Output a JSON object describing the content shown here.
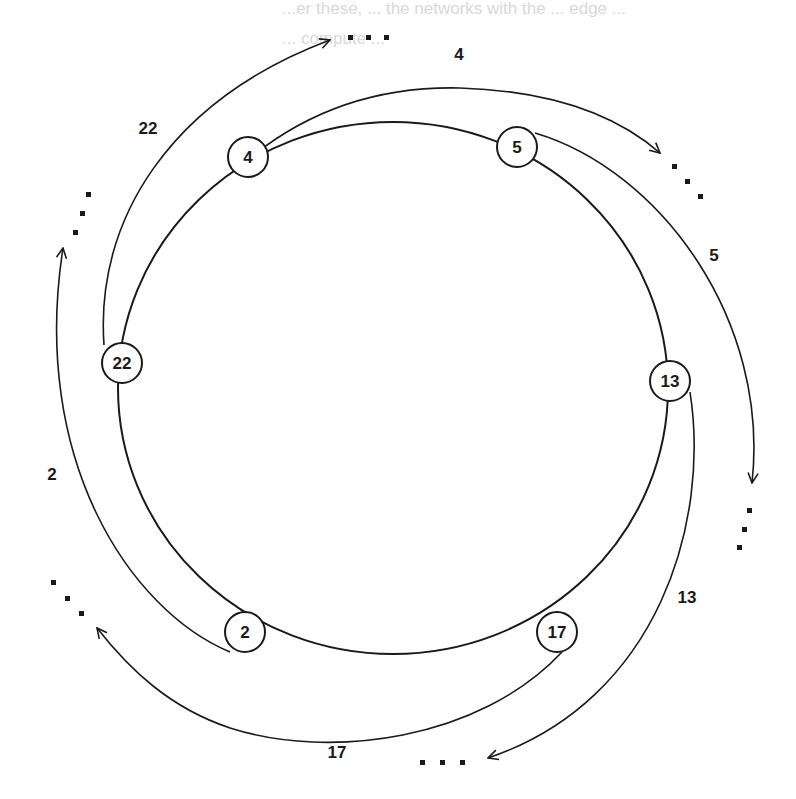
{
  "figure": {
    "type": "ring-network-diagram",
    "bleed_through_text": [
      "...er these, ... the networks with the ... edge ...",
      "... compute ..."
    ]
  },
  "nodes": [
    {
      "id": "4",
      "label": "4",
      "x": 248,
      "y": 157
    },
    {
      "id": "5",
      "label": "5",
      "x": 517,
      "y": 147
    },
    {
      "id": "13",
      "label": "13",
      "x": 670,
      "y": 381
    },
    {
      "id": "17",
      "label": "17",
      "x": 557,
      "y": 632
    },
    {
      "id": "2",
      "label": "2",
      "x": 245,
      "y": 632
    },
    {
      "id": "22",
      "label": "22",
      "x": 122,
      "y": 363
    }
  ],
  "edges": [
    {
      "from": "22",
      "label": "22",
      "label_x": 148,
      "label_y": 128,
      "target": "..."
    },
    {
      "from": "4",
      "label": "4",
      "label_x": 459,
      "label_y": 54,
      "target": "..."
    },
    {
      "from": "5",
      "label": "5",
      "label_x": 714,
      "label_y": 255,
      "target": "..."
    },
    {
      "from": "13",
      "label": "13",
      "label_x": 687,
      "label_y": 597,
      "target": "..."
    },
    {
      "from": "17",
      "label": "17",
      "label_x": 337,
      "label_y": 752,
      "target": "..."
    },
    {
      "from": "2",
      "label": "2",
      "label_x": 52,
      "label_y": 474,
      "target": "..."
    }
  ],
  "ellipsis_symbol": "...",
  "colors": {
    "stroke": "#1a1a1a",
    "background": "#ffffff",
    "bleed": "#d8d8d8"
  }
}
